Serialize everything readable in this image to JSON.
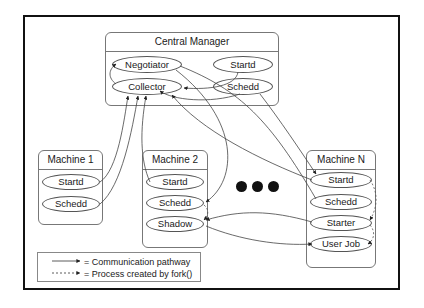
{
  "diagram": {
    "central_manager": {
      "title": "Central Manager",
      "daemons": [
        "Negotiator",
        "Startd",
        "Collector",
        "Schedd"
      ]
    },
    "machines": [
      {
        "title": "Machine 1",
        "daemons": [
          "Startd",
          "Schedd"
        ]
      },
      {
        "title": "Machine 2",
        "daemons": [
          "Startd",
          "Schedd",
          "Shadow"
        ]
      },
      {
        "title": "Machine N",
        "daemons": [
          "Startd",
          "Schedd",
          "Starter",
          "User Job"
        ]
      }
    ],
    "ellipsis": "• • •",
    "legend": {
      "communication": "= Communication pathway",
      "fork": "= Process created by fork()"
    },
    "colors": {
      "line": "#333333",
      "frame": "#111111",
      "box_border": "#777777"
    }
  }
}
